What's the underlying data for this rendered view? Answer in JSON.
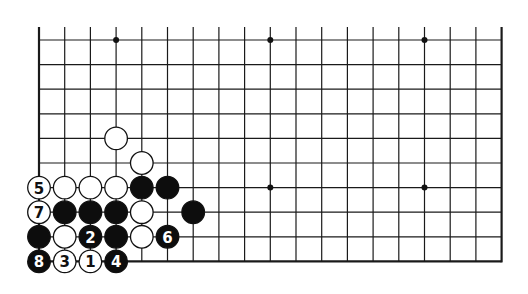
{
  "diagram": {
    "type": "go-board-diagram",
    "board": {
      "columns": 19,
      "rows_shown": 10,
      "open_top": true,
      "edges": [
        "left",
        "right",
        "bottom"
      ],
      "origin_x": 39,
      "origin_y": 40,
      "spacing_x": 25.7,
      "spacing_y": 24.6,
      "line_color": "#1a1a1a"
    },
    "star_points": [
      {
        "col": 3,
        "row": 0
      },
      {
        "col": 9,
        "row": 0
      },
      {
        "col": 15,
        "row": 0
      },
      {
        "col": 9,
        "row": 6
      },
      {
        "col": 15,
        "row": 6
      }
    ],
    "stones": [
      {
        "col": 3,
        "row": 4,
        "color": "white",
        "label": ""
      },
      {
        "col": 4,
        "row": 5,
        "color": "white",
        "label": ""
      },
      {
        "col": 0,
        "row": 6,
        "color": "white",
        "label": "5"
      },
      {
        "col": 1,
        "row": 6,
        "color": "white",
        "label": ""
      },
      {
        "col": 2,
        "row": 6,
        "color": "white",
        "label": ""
      },
      {
        "col": 3,
        "row": 6,
        "color": "white",
        "label": ""
      },
      {
        "col": 4,
        "row": 6,
        "color": "black",
        "label": ""
      },
      {
        "col": 5,
        "row": 6,
        "color": "black",
        "label": ""
      },
      {
        "col": 0,
        "row": 7,
        "color": "white",
        "label": "7"
      },
      {
        "col": 1,
        "row": 7,
        "color": "black",
        "label": ""
      },
      {
        "col": 2,
        "row": 7,
        "color": "black",
        "label": ""
      },
      {
        "col": 3,
        "row": 7,
        "color": "black",
        "label": ""
      },
      {
        "col": 4,
        "row": 7,
        "color": "white",
        "label": ""
      },
      {
        "col": 6,
        "row": 7,
        "color": "black",
        "label": ""
      },
      {
        "col": 0,
        "row": 8,
        "color": "black",
        "label": ""
      },
      {
        "col": 1,
        "row": 8,
        "color": "white",
        "label": ""
      },
      {
        "col": 2,
        "row": 8,
        "color": "black",
        "label": "2"
      },
      {
        "col": 3,
        "row": 8,
        "color": "black",
        "label": ""
      },
      {
        "col": 4,
        "row": 8,
        "color": "white",
        "label": ""
      },
      {
        "col": 5,
        "row": 8,
        "color": "black",
        "label": "6"
      },
      {
        "col": 0,
        "row": 9,
        "color": "black",
        "label": "8"
      },
      {
        "col": 1,
        "row": 9,
        "color": "white",
        "label": "3"
      },
      {
        "col": 2,
        "row": 9,
        "color": "white",
        "label": "1"
      },
      {
        "col": 3,
        "row": 9,
        "color": "black",
        "label": "4"
      }
    ],
    "move_sequence": [
      "1",
      "2",
      "3",
      "4",
      "5",
      "6",
      "7",
      "8"
    ]
  }
}
